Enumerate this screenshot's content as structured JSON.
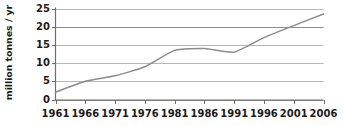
{
  "chart_data": {
    "type": "line",
    "title": "",
    "subtitle": "",
    "xlabel": "",
    "ylabel": "million tonnes / yr",
    "x": [
      1961,
      1966,
      1971,
      1976,
      1981,
      1986,
      1991,
      1996,
      2001,
      2006
    ],
    "values": [
      2.0,
      5.0,
      6.5,
      9.0,
      13.5,
      14.0,
      13.0,
      17.0,
      20.3,
      23.5
    ],
    "series": [
      {
        "name": "million tonnes / yr",
        "values": [
          2.0,
          5.0,
          6.5,
          9.0,
          13.5,
          14.0,
          13.0,
          17.0,
          20.3,
          23.5
        ]
      }
    ],
    "categories": [
      "1961",
      "1966",
      "1971",
      "1976",
      "1981",
      "1986",
      "1991",
      "1996",
      "2001",
      "2006"
    ],
    "xlim": [
      1961,
      2006
    ],
    "ylim": [
      0,
      25
    ],
    "ytick_labels": [
      "0",
      "5",
      "10",
      "15",
      "20",
      "25"
    ],
    "ytick_values": [
      0,
      5,
      10,
      15,
      20,
      25
    ],
    "xtick_labels": [
      "1961",
      "1966",
      "1971",
      "1976",
      "1981",
      "1986",
      "1991",
      "1996",
      "2001",
      "2006"
    ],
    "grid": "horizontal",
    "legend": "none",
    "line_color": "#8c8c8c",
    "grid_color": "#a8a8a8",
    "axis_color": "#6e6e6e",
    "text_color": "#1b1b1b",
    "background_color": "#ffffff"
  }
}
